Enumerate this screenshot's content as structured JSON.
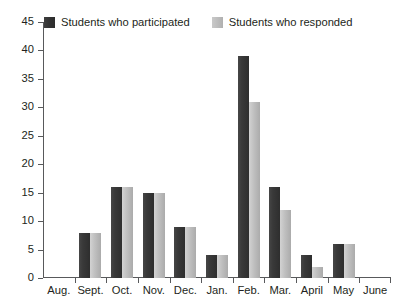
{
  "chart_data": {
    "type": "bar",
    "title": "",
    "xlabel": "",
    "ylabel": "",
    "categories": [
      "Aug.",
      "Sept.",
      "Oct.",
      "Nov.",
      "Dec.",
      "Jan.",
      "Feb.",
      "Mar.",
      "April",
      "May",
      "June"
    ],
    "series": [
      {
        "name": "Students who participated",
        "color": "#363636",
        "values": [
          0,
          8,
          16,
          15,
          9,
          4,
          39,
          16,
          4,
          6,
          0
        ]
      },
      {
        "name": "Students who responded",
        "color": "#bdbdbd",
        "values": [
          0,
          8,
          16,
          15,
          9,
          4,
          31,
          12,
          2,
          6,
          0
        ]
      }
    ],
    "ylim": [
      0,
      45
    ],
    "ytick_labels": [
      "0",
      "5",
      "10",
      "15",
      "20",
      "25",
      "30",
      "35",
      "40",
      "45"
    ],
    "ytick_values": [
      0,
      5,
      10,
      15,
      20,
      25,
      30,
      35,
      40,
      45
    ],
    "grid": false,
    "legend_position": "top-left",
    "axis_color": "#58595b"
  },
  "legend": {
    "entries": [
      {
        "label": "Students who participated",
        "swatch": "dark"
      },
      {
        "label": "Students who responded",
        "swatch": "light"
      }
    ]
  }
}
